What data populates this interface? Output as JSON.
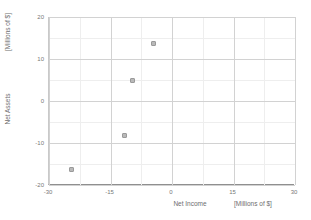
{
  "chart_data": {
    "type": "scatter",
    "title": "",
    "xlabel": "Net Income",
    "ylabel": "Net Assets",
    "x_unit_label": "[Millions of $]",
    "y_unit_label": "[Millions of $]",
    "xlim": [
      -30,
      30
    ],
    "ylim": [
      -20,
      20
    ],
    "xticks": [
      -30,
      -15,
      0,
      15,
      30
    ],
    "yticks": [
      20,
      10,
      0,
      -10,
      -20
    ],
    "xtick_labels": [
      "-30",
      "-15",
      "0",
      "15",
      "30"
    ],
    "ytick_labels": [
      "20",
      "10",
      "0",
      "-10",
      "-20"
    ],
    "grid": true,
    "grid_minor": true,
    "x_minor_step": 7.5,
    "y_minor_step": 5,
    "legend": false,
    "marker_color": "#b9b9b9",
    "marker_edge_color": "#9a9a9a",
    "grid_color": "#e3e3e3",
    "axis_color": "#8f8f8f",
    "series": [
      {
        "name": "observations",
        "points": [
          {
            "x": -24.4,
            "y": -16.4
          },
          {
            "x": -11.7,
            "y": -8.1
          },
          {
            "x": -9.7,
            "y": 5.0
          },
          {
            "x": -4.4,
            "y": 13.6
          }
        ]
      }
    ]
  }
}
